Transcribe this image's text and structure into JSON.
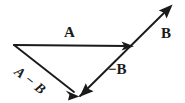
{
  "figure": {
    "background_color": "#ffffff",
    "stroke_color": "#1a1a1a",
    "width": 185,
    "height": 103,
    "labels": {
      "vector_a": "A",
      "vector_b": "B",
      "vector_neg_b": "−B",
      "vector_a_minus_b": "A − B"
    },
    "vectors": [
      {
        "name": "A",
        "label": "A",
        "tail": [
          14,
          45
        ],
        "tip": [
          134,
          46
        ],
        "style": "solid",
        "arrowhead": "tip",
        "label_position": [
          64,
          25
        ],
        "label_style": "bold-upright"
      },
      {
        "name": "B",
        "label": "B",
        "tail": [
          80,
          97
        ],
        "tip": [
          172,
          5
        ],
        "style": "solid",
        "arrowhead": "tip",
        "label_position": [
          161,
          26
        ],
        "label_style": "bold-upright"
      },
      {
        "name": "-B",
        "label": "−B",
        "tail": [
          134,
          46
        ],
        "tip": [
          80,
          97
        ],
        "style": "solid",
        "arrowhead": "tip",
        "label_position": [
          108,
          62
        ],
        "label_style": "bold-upright"
      },
      {
        "name": "A-B",
        "label": "A − B",
        "tail": [
          14,
          45
        ],
        "tip": [
          80,
          97
        ],
        "style": "solid",
        "arrowhead": "tip",
        "label_position": [
          16,
          63
        ],
        "label_style": "bold-italic-rotated",
        "label_rotation_deg": 38
      }
    ]
  }
}
